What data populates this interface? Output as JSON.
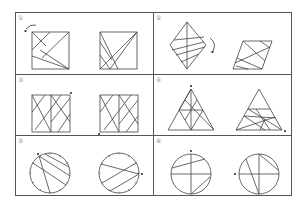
{
  "caption": "",
  "panels": [
    {
      "label": "①",
      "shape": "square",
      "description": "Square with diagonal segments; rotate counter-clockwise (arrow)"
    },
    {
      "label": "②",
      "shape": "rhombus",
      "description": "Rhombus with diagonal and parallel segments; rotate clockwise (arrow)"
    },
    {
      "label": "③",
      "shape": "double-square",
      "description": "Rectangle split into two squares with crossing diagonals; marked corner dot"
    },
    {
      "label": "④",
      "shape": "triangle",
      "description": "Equilateral triangle with internal segments; marked vertex dot"
    },
    {
      "label": "⑤",
      "shape": "circle-ticks",
      "description": "Circle with tick marks and chords; marked point dot"
    },
    {
      "label": "⑥",
      "shape": "circle-cross",
      "description": "Circle with cross diameters and chords; marked point dot"
    }
  ]
}
